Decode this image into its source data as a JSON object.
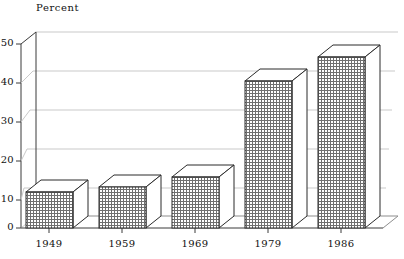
{
  "chart_data": {
    "type": "bar",
    "title": "",
    "subtitle": "",
    "xlabel": "",
    "ylabel": "Percent",
    "ylabel_position": "top-left",
    "categories": [
      "1949",
      "1959",
      "1969",
      "1979",
      "1986"
    ],
    "values": [
      9.3,
      10.4,
      13.0,
      37.5,
      43.7
    ],
    "series": [
      {
        "name": "Percent",
        "values": [
          9.3,
          10.4,
          13.0,
          37.5,
          43.7
        ]
      }
    ],
    "ylim": [
      0,
      50
    ],
    "ytick_values": [
      0,
      10,
      20,
      30,
      40,
      50
    ],
    "ytick_labels": [
      "0",
      "10",
      "20",
      "30",
      "40",
      "50"
    ],
    "xtick_labels": [
      "1949",
      "1959",
      "1969",
      "1979",
      "1986"
    ],
    "grid": true,
    "grid_axis": "y",
    "legend": false,
    "legend_position": "none",
    "style": "3d-isometric-bars",
    "bar_fill": "crosshatch-pattern",
    "annotations": []
  },
  "axis": {
    "y_title": "Percent",
    "y_ticks": [
      "50",
      "40",
      "30",
      "20",
      "10",
      "0"
    ],
    "x_ticks": [
      "1949",
      "1959",
      "1969",
      "1979",
      "1986"
    ]
  },
  "colors": {
    "background": "#ffffff",
    "axis": "#3a3a3a",
    "grid": "#c9c9c9",
    "bar_outline": "#2b2b2b",
    "bar_fill_line": "#6f6f6f",
    "text": "#111111"
  }
}
